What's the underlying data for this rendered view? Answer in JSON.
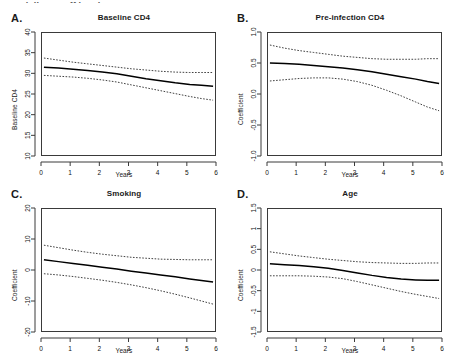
{
  "figure": {
    "top_cropped_text": "partially cut off header text",
    "xlabel": "Years",
    "xticks": [
      "0",
      "1",
      "2",
      "3",
      "4",
      "5",
      "6"
    ],
    "xlim": [
      0,
      6
    ]
  },
  "chart_data": [
    {
      "type": "line",
      "panel": "A.",
      "title": "Baseline CD4",
      "xlabel": "Years",
      "ylabel": "Baseline CD4",
      "xlim": [
        0,
        6
      ],
      "ylim": [
        10,
        40
      ],
      "xticks": [
        "0",
        "1",
        "2",
        "3",
        "4",
        "5",
        "6"
      ],
      "yticks": [
        "10",
        "15",
        "20",
        "25",
        "30",
        "35",
        "40"
      ],
      "grid": false,
      "legend": "none",
      "x": [
        0.1,
        0.6,
        1.1,
        1.6,
        2.1,
        2.6,
        3.1,
        3.6,
        4.1,
        4.6,
        5.1,
        5.5,
        5.9
      ],
      "series": [
        {
          "name": "estimate",
          "style": "solid",
          "values": [
            31.5,
            31.3,
            31.0,
            30.7,
            30.3,
            29.9,
            29.3,
            28.7,
            28.2,
            27.7,
            27.3,
            27.1,
            26.9
          ]
        },
        {
          "name": "upper 95% CI",
          "style": "dashed",
          "values": [
            33.7,
            33.2,
            32.7,
            32.3,
            31.9,
            31.5,
            31.1,
            30.8,
            30.5,
            30.3,
            30.2,
            30.2,
            30.2
          ]
        },
        {
          "name": "lower 95% CI",
          "style": "dashed",
          "values": [
            29.5,
            29.3,
            29.1,
            28.8,
            28.4,
            27.9,
            27.2,
            26.5,
            25.8,
            25.1,
            24.4,
            23.9,
            23.5
          ]
        }
      ]
    },
    {
      "type": "line",
      "panel": "B.",
      "title": "Pre-infection CD4",
      "xlabel": "Years",
      "ylabel": "Coefficient",
      "xlim": [
        0,
        6
      ],
      "ylim": [
        -1.0,
        1.0
      ],
      "xticks": [
        "0",
        "1",
        "2",
        "3",
        "4",
        "5",
        "6"
      ],
      "yticks": [
        "-1.0",
        "-0.5",
        "0.0",
        "0.5",
        "1.0"
      ],
      "grid": false,
      "legend": "none",
      "x": [
        0.1,
        0.6,
        1.1,
        1.6,
        2.1,
        2.6,
        3.1,
        3.6,
        4.1,
        4.6,
        5.1,
        5.5,
        5.9
      ],
      "series": [
        {
          "name": "estimate",
          "style": "solid",
          "values": [
            0.5,
            0.49,
            0.48,
            0.46,
            0.44,
            0.42,
            0.39,
            0.36,
            0.32,
            0.28,
            0.24,
            0.2,
            0.17
          ]
        },
        {
          "name": "upper 95% CI",
          "style": "dashed",
          "values": [
            0.79,
            0.74,
            0.7,
            0.67,
            0.64,
            0.61,
            0.59,
            0.57,
            0.56,
            0.56,
            0.56,
            0.57,
            0.57
          ]
        },
        {
          "name": "lower 95% CI",
          "style": "dashed",
          "values": [
            0.21,
            0.23,
            0.25,
            0.26,
            0.26,
            0.24,
            0.2,
            0.14,
            0.06,
            -0.03,
            -0.13,
            -0.21,
            -0.27
          ]
        }
      ]
    },
    {
      "type": "line",
      "panel": "C.",
      "title": "Smoking",
      "xlabel": "Years",
      "ylabel": "Coefficient",
      "xlim": [
        0,
        6
      ],
      "ylim": [
        -20,
        20
      ],
      "xticks": [
        "0",
        "1",
        "2",
        "3",
        "4",
        "5",
        "6"
      ],
      "yticks": [
        "-20",
        "-10",
        "0",
        "10",
        "20"
      ],
      "grid": false,
      "legend": "none",
      "x": [
        0.1,
        0.6,
        1.1,
        1.6,
        2.1,
        2.6,
        3.1,
        3.6,
        4.1,
        4.6,
        5.1,
        5.5,
        5.9
      ],
      "series": [
        {
          "name": "estimate",
          "style": "solid",
          "values": [
            3.3,
            2.7,
            2.1,
            1.5,
            0.9,
            0.3,
            -0.4,
            -1.0,
            -1.6,
            -2.2,
            -2.9,
            -3.4,
            -3.9
          ]
        },
        {
          "name": "upper 95% CI",
          "style": "dashed",
          "values": [
            8.0,
            7.2,
            6.4,
            5.7,
            5.1,
            4.6,
            4.1,
            3.8,
            3.5,
            3.4,
            3.3,
            3.3,
            3.3
          ]
        },
        {
          "name": "lower 95% CI",
          "style": "dashed",
          "values": [
            -1.2,
            -1.6,
            -2.1,
            -2.7,
            -3.3,
            -4.0,
            -4.8,
            -5.7,
            -6.7,
            -7.8,
            -9.0,
            -10.0,
            -11.0
          ]
        }
      ]
    },
    {
      "type": "line",
      "panel": "D.",
      "title": "Age",
      "xlabel": "Years",
      "ylabel": "Coefficient",
      "xlim": [
        -1.5,
        1.5
      ],
      "ylim": [
        -1.5,
        1.5
      ],
      "xticks": [
        "0",
        "1",
        "2",
        "3",
        "4",
        "5",
        "6"
      ],
      "yticks": [
        "-1.5",
        "-1",
        "-0.5",
        "0",
        "0.5",
        "1",
        "1.5"
      ],
      "grid": false,
      "legend": "none",
      "x": [
        0.1,
        0.6,
        1.1,
        1.6,
        2.1,
        2.6,
        3.1,
        3.6,
        4.1,
        4.6,
        5.1,
        5.5,
        5.9
      ],
      "series": [
        {
          "name": "estimate",
          "style": "solid",
          "values": [
            0.15,
            0.13,
            0.11,
            0.08,
            0.04,
            -0.01,
            -0.07,
            -0.13,
            -0.18,
            -0.22,
            -0.24,
            -0.25,
            -0.25
          ]
        },
        {
          "name": "upper 95% CI",
          "style": "dashed",
          "values": [
            0.44,
            0.39,
            0.34,
            0.3,
            0.26,
            0.23,
            0.2,
            0.18,
            0.17,
            0.16,
            0.16,
            0.17,
            0.17
          ]
        },
        {
          "name": "lower 95% CI",
          "style": "dashed",
          "values": [
            -0.14,
            -0.14,
            -0.14,
            -0.15,
            -0.17,
            -0.21,
            -0.28,
            -0.36,
            -0.44,
            -0.52,
            -0.59,
            -0.64,
            -0.69
          ]
        }
      ]
    }
  ]
}
